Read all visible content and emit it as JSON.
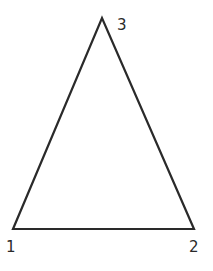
{
  "diagram": {
    "type": "triangle",
    "stroke_color": "#2a2a2a",
    "background": "#ffffff",
    "vertices": [
      {
        "id": "1",
        "label": "1",
        "x": 13,
        "y": 229,
        "label_x": 6,
        "label_y": 252
      },
      {
        "id": "2",
        "label": "2",
        "x": 194,
        "y": 229,
        "label_x": 189,
        "label_y": 252
      },
      {
        "id": "3",
        "label": "3",
        "x": 102,
        "y": 18,
        "label_x": 117,
        "label_y": 30
      }
    ],
    "edges": [
      [
        "1",
        "2"
      ],
      [
        "2",
        "3"
      ],
      [
        "3",
        "1"
      ]
    ]
  }
}
